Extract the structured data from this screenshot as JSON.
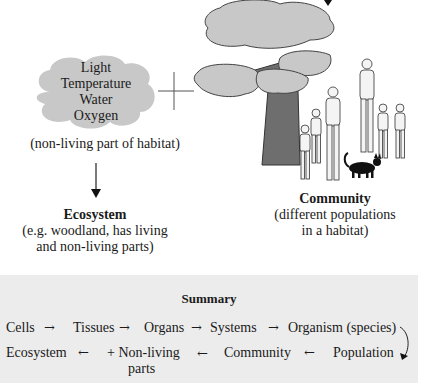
{
  "diagram": {
    "cloud": {
      "lines": [
        "Light",
        "Temperature",
        "Water",
        "Oxygen"
      ],
      "caption": "(non-living part of habitat)"
    },
    "plus_sign": "+",
    "ecosystem": {
      "title": "Ecosystem",
      "desc_line1": "(e.g. woodland, has living",
      "desc_line2": "and non-living parts)"
    },
    "community": {
      "title": "Community",
      "desc_line1": "(different populations",
      "desc_line2": "in a habitat)"
    },
    "colors": {
      "cloud_fill": "#c8c8c8",
      "trunk": "#6e6e6e",
      "summary_bg": "#ececec"
    }
  },
  "summary": {
    "title": "Summary",
    "row1": [
      "Cells",
      "Tissues",
      "Organs",
      "Systems",
      "Organism (species)"
    ],
    "row2": [
      "Ecosystem",
      "+ Non-living",
      "parts",
      "Community",
      "Population"
    ],
    "arrow_right": "→",
    "arrow_left": "←"
  }
}
